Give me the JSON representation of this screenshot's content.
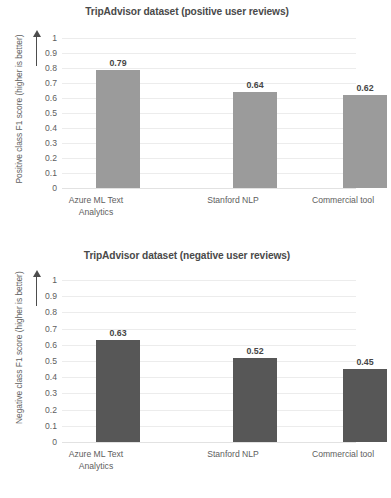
{
  "charts": [
    {
      "id": "positive",
      "title": "TripAdvisor dataset (positive user reviews)",
      "ylabel": "Positive class F1 score (higher is better)",
      "bar_color": "#9b9b9b"
    },
    {
      "id": "negative",
      "title": "TripAdvisor dataset (negative user reviews)",
      "ylabel": "Negative class F1 score (higher is better)",
      "bar_color": "#575757"
    }
  ],
  "yticks": [
    "1",
    "0.9",
    "0.8",
    "0.7",
    "0.6",
    "0.5",
    "0.4",
    "0.3",
    "0.2",
    "0.1",
    "0"
  ],
  "categories": [
    {
      "line1": "Azure ML Text",
      "line2": "Analytics"
    },
    {
      "line1": "Stanford NLP",
      "line2": ""
    },
    {
      "line1": "Commercial tool",
      "line2": ""
    }
  ],
  "positive_values": [
    "0.79",
    "0.64",
    "0.62"
  ],
  "negative_values": [
    "0.63",
    "0.52",
    "0.45"
  ],
  "bottom_fragment": "",
  "chart_data": [
    {
      "type": "bar",
      "title": "TripAdvisor dataset (positive user reviews)",
      "xlabel": "",
      "ylabel": "Positive class F1 score (higher is better)",
      "categories": [
        "Azure ML Text Analytics",
        "Stanford NLP",
        "Commercial tool"
      ],
      "values": [
        0.79,
        0.64,
        0.62
      ],
      "data_labels": [
        "0.79",
        "0.64",
        "0.62"
      ],
      "ylim": [
        0,
        1
      ],
      "ytick_step": 0.1,
      "ytick_labels": [
        "0",
        "0.1",
        "0.2",
        "0.3",
        "0.4",
        "0.5",
        "0.6",
        "0.7",
        "0.8",
        "0.9",
        "1"
      ],
      "grid": "horizontal",
      "legend": "none",
      "bar_color": "#9b9b9b"
    },
    {
      "type": "bar",
      "title": "TripAdvisor dataset (negative user reviews)",
      "xlabel": "",
      "ylabel": "Negative class F1 score (higher is better)",
      "categories": [
        "Azure ML Text Analytics",
        "Stanford NLP",
        "Commercial tool"
      ],
      "values": [
        0.63,
        0.52,
        0.45
      ],
      "data_labels": [
        "0.63",
        "0.52",
        "0.45"
      ],
      "ylim": [
        0,
        1
      ],
      "ytick_step": 0.1,
      "ytick_labels": [
        "0",
        "0.1",
        "0.2",
        "0.3",
        "0.4",
        "0.5",
        "0.6",
        "0.7",
        "0.8",
        "0.9",
        "1"
      ],
      "grid": "horizontal",
      "legend": "none",
      "bar_color": "#575757"
    }
  ]
}
